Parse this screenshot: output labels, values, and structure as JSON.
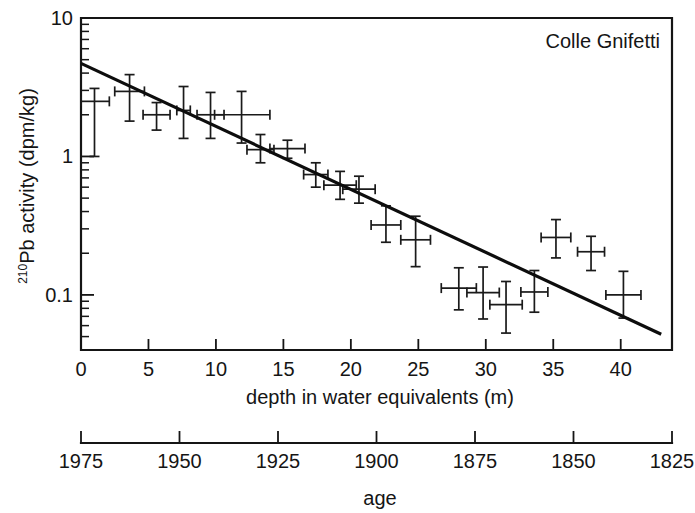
{
  "figure": {
    "panel_label": "Colle Gnifetti",
    "background_color": "#ffffff",
    "ink_color": "#151515"
  },
  "chart_data": {
    "type": "scatter",
    "title": "Colle Gnifetti",
    "xlabel": "depth in water equivalents (m)",
    "ylabel": "²¹⁰Pb activity (dpm/kg)",
    "ylabel_superscript": "210",
    "ylabel_main": "Pb activity (dpm/kg)",
    "yscale": "log",
    "ylim": [
      0.04,
      10
    ],
    "xlim": [
      0,
      43.8
    ],
    "grid": false,
    "legend": null,
    "x_ticks": [
      0,
      5,
      10,
      15,
      20,
      25,
      30,
      35,
      40
    ],
    "x_tick_labels": [
      "0",
      "5",
      "10",
      "15",
      "20",
      "25",
      "30",
      "35",
      "40"
    ],
    "y_ticks": [
      10,
      1,
      0.1
    ],
    "y_tick_labels": [
      "10",
      "1",
      "0.1"
    ],
    "secondary_axis": {
      "label": "age",
      "ticks": [
        1975,
        1950,
        1925,
        1900,
        1875,
        1850,
        1825
      ],
      "tick_labels": [
        "1975",
        "1950",
        "1925",
        "1900",
        "1875",
        "1850",
        "1825"
      ],
      "direction": "decreasing",
      "range": [
        1975,
        1825
      ]
    },
    "fit_line": {
      "label": "exponential fit",
      "x_start": 0.0,
      "x_end": 43.0,
      "y_start": 4.7,
      "y_end": 0.052
    },
    "points": [
      {
        "x": 1.0,
        "y": 2.5,
        "xerr_low": 1.0,
        "xerr_high": 1.1,
        "yerr_low": 1.5,
        "yerr_high": 0.6
      },
      {
        "x": 3.6,
        "y": 2.95,
        "xerr_low": 1.1,
        "xerr_high": 1.1,
        "yerr_low": 1.15,
        "yerr_high": 0.95
      },
      {
        "x": 5.6,
        "y": 2.0,
        "xerr_low": 1.0,
        "xerr_high": 1.0,
        "yerr_low": 0.45,
        "yerr_high": 0.45
      },
      {
        "x": 7.6,
        "y": 2.15,
        "xerr_low": 0.5,
        "xerr_high": 0.5,
        "yerr_low": 0.8,
        "yerr_high": 1.05
      },
      {
        "x": 9.6,
        "y": 2.0,
        "xerr_low": 1.0,
        "xerr_high": 1.0,
        "yerr_low": 0.65,
        "yerr_high": 0.9
      },
      {
        "x": 11.9,
        "y": 2.0,
        "xerr_low": 2.0,
        "xerr_high": 2.1,
        "yerr_low": 0.75,
        "yerr_high": 0.95
      },
      {
        "x": 13.3,
        "y": 1.12,
        "xerr_low": 1.0,
        "xerr_high": 1.0,
        "yerr_low": 0.22,
        "yerr_high": 0.32
      },
      {
        "x": 15.3,
        "y": 1.14,
        "xerr_low": 1.3,
        "xerr_high": 1.3,
        "yerr_low": 0.17,
        "yerr_high": 0.17
      },
      {
        "x": 17.4,
        "y": 0.74,
        "xerr_low": 0.9,
        "xerr_high": 0.9,
        "yerr_low": 0.14,
        "yerr_high": 0.16
      },
      {
        "x": 19.2,
        "y": 0.62,
        "xerr_low": 1.2,
        "xerr_high": 1.2,
        "yerr_low": 0.13,
        "yerr_high": 0.16
      },
      {
        "x": 20.6,
        "y": 0.58,
        "xerr_low": 1.2,
        "xerr_high": 1.2,
        "yerr_low": 0.12,
        "yerr_high": 0.14
      },
      {
        "x": 22.6,
        "y": 0.32,
        "xerr_low": 1.1,
        "xerr_high": 1.1,
        "yerr_low": 0.08,
        "yerr_high": 0.12
      },
      {
        "x": 24.8,
        "y": 0.25,
        "xerr_low": 1.1,
        "xerr_high": 1.1,
        "yerr_low": 0.09,
        "yerr_high": 0.12
      },
      {
        "x": 28.0,
        "y": 0.112,
        "xerr_low": 1.3,
        "xerr_high": 1.3,
        "yerr_low": 0.034,
        "yerr_high": 0.045
      },
      {
        "x": 29.8,
        "y": 0.104,
        "xerr_low": 1.2,
        "xerr_high": 1.2,
        "yerr_low": 0.037,
        "yerr_high": 0.055
      },
      {
        "x": 31.5,
        "y": 0.085,
        "xerr_low": 1.2,
        "xerr_high": 1.2,
        "yerr_low": 0.032,
        "yerr_high": 0.04
      },
      {
        "x": 33.6,
        "y": 0.105,
        "xerr_low": 1.0,
        "xerr_high": 1.0,
        "yerr_low": 0.03,
        "yerr_high": 0.045
      },
      {
        "x": 35.2,
        "y": 0.26,
        "xerr_low": 1.1,
        "xerr_high": 1.1,
        "yerr_low": 0.075,
        "yerr_high": 0.09
      },
      {
        "x": 37.8,
        "y": 0.205,
        "xerr_low": 1.0,
        "xerr_high": 1.0,
        "yerr_low": 0.055,
        "yerr_high": 0.06
      },
      {
        "x": 40.2,
        "y": 0.1,
        "xerr_low": 1.3,
        "xerr_high": 1.3,
        "yerr_low": 0.032,
        "yerr_high": 0.048
      }
    ]
  }
}
